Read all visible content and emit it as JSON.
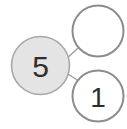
{
  "diagram": {
    "name": "node-link-diagram",
    "background_color": "#ffffff",
    "width": 127,
    "height": 129,
    "colors": {
      "node_outline": "#8c8c8c",
      "node_fill_selected": "#e4e4e4",
      "node_fill_empty": "#ffffff",
      "label_text": "#333333",
      "edge_stroke": "#9a9a9a"
    },
    "nodes": [
      {
        "id": "node-root",
        "name": "node-root-5",
        "label": "5",
        "cx": 40.5,
        "cy": 65.5,
        "r": 29,
        "fill": "#e4e4e4",
        "stroke": "#a8a8a8",
        "stroke_width": 1.6,
        "font_size": 30,
        "label_color": "#2e2e2e",
        "state": "filled"
      },
      {
        "id": "node-top",
        "name": "node-top-empty",
        "label": "",
        "cx": 98,
        "cy": 31,
        "r": 25.5,
        "fill": "#ffffff",
        "stroke": "#8c8c8c",
        "stroke_width": 2,
        "font_size": 28,
        "label_color": "#2e2e2e",
        "state": "empty"
      },
      {
        "id": "node-bottom",
        "name": "node-bottom-1",
        "label": "1",
        "cx": 98,
        "cy": 96,
        "r": 25.5,
        "fill": "#ffffff",
        "stroke": "#8c8c8c",
        "stroke_width": 2,
        "font_size": 28,
        "label_color": "#2e2e2e",
        "state": "empty"
      }
    ],
    "edges": [
      {
        "id": "edge-root-top",
        "name": "edge-root-to-top",
        "from": "node-root",
        "to": "node-top",
        "x1": 62.5,
        "y1": 62.5,
        "x2": 77.5,
        "y2": 48.5,
        "stroke": "#9a9a9a",
        "stroke_width": 1.2
      },
      {
        "id": "edge-root-bottom",
        "name": "edge-root-to-bottom",
        "from": "node-root",
        "to": "node-bottom",
        "x1": 62.5,
        "y1": 70.5,
        "x2": 78,
        "y2": 80.5,
        "stroke": "#9a9a9a",
        "stroke_width": 1.2
      }
    ]
  }
}
